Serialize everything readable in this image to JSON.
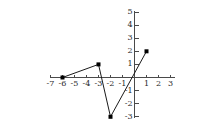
{
  "chart_data": {
    "type": "line",
    "title": "",
    "subtitle": "",
    "xlabel": "",
    "ylabel": "",
    "xlim": [
      -7,
      3
    ],
    "ylim": [
      -3,
      5
    ],
    "grid": false,
    "legend": null,
    "x_ticks": [
      -7,
      -6,
      -5,
      -4,
      -3,
      -2,
      -1,
      1,
      2,
      3
    ],
    "x_tick_labels": [
      "-7",
      "-6",
      "-5",
      "-4",
      "-3",
      "-2",
      "-1",
      "1",
      "2",
      "3"
    ],
    "y_ticks": [
      5,
      4,
      3,
      2,
      1,
      -1,
      -2,
      -3
    ],
    "y_tick_labels": [
      "5",
      "4",
      "3",
      "2",
      "1",
      "-1",
      "-2",
      "-3"
    ],
    "series": [
      {
        "name": "piecewise-linear-function",
        "x": [
          -6,
          -3,
          -2,
          1
        ],
        "y": [
          0,
          1,
          -3,
          2
        ],
        "points": [
          {
            "x": -6,
            "y": 0
          },
          {
            "x": -3,
            "y": 1
          },
          {
            "x": -2,
            "y": -3
          },
          {
            "x": 1,
            "y": 2
          }
        ],
        "marker": "filled-square",
        "marker_color": "#000000",
        "line_color": "#1a1a1a"
      }
    ]
  },
  "figure": {
    "background_color": "#ffffff",
    "axis_color": "#4a4a4a",
    "text_color": "#2a2a2a"
  }
}
